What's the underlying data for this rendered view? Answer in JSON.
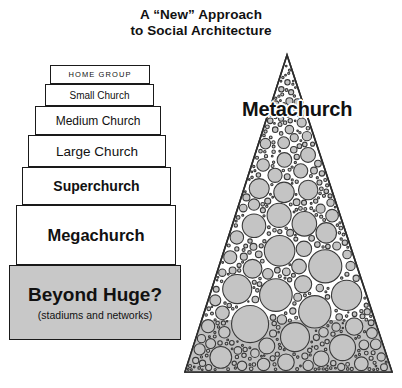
{
  "title": {
    "line1": "A “New” Approach",
    "line2": "to Social Architecture"
  },
  "pyramid": {
    "name": "church-size-step-pyramid",
    "steps": [
      {
        "label": "HOME GROUP",
        "sub": "",
        "style": "caps-small",
        "fill": "#ffffff"
      },
      {
        "label": "Small Church",
        "sub": "",
        "style": "regular-small",
        "fill": "#ffffff"
      },
      {
        "label": "Medium Church",
        "sub": "",
        "style": "regular-medium",
        "fill": "#ffffff"
      },
      {
        "label": "Large Church",
        "sub": "",
        "style": "regular-large",
        "fill": "#ffffff"
      },
      {
        "label": "Superchurch",
        "sub": "",
        "style": "bold-large",
        "fill": "#ffffff"
      },
      {
        "label": "Megachurch",
        "sub": "",
        "style": "bold-xlarge",
        "fill": "#ffffff"
      },
      {
        "label": "Beyond Huge?",
        "sub": "(stadiums and networks)",
        "style": "bold-xxlarge",
        "fill": "#c8c8c8"
      }
    ]
  },
  "metachurch": {
    "label": "Metachurch",
    "shape": "circle-packed-triangle",
    "circle_fill": "#c4c4c4",
    "circle_stroke": "#3a3a3a",
    "base_fill": "#c0c0c0"
  },
  "colors": {
    "ink": "#111111",
    "outline": "#1a1a1a",
    "shaded_fill": "#c8c8c8",
    "background": "#ffffff"
  }
}
